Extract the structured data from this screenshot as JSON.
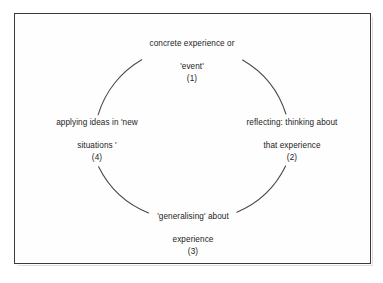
{
  "diagram": {
    "frame": {
      "border_color": "#3a3a3a"
    },
    "circle": {
      "stroke_color": "#4a4a4a",
      "center_x": 192,
      "center_y": 140,
      "radius": 95
    },
    "stages": [
      {
        "id": "stage-1",
        "position": "top",
        "line1": "concrete experience or",
        "line2": "'event'",
        "number": "(1)"
      },
      {
        "id": "stage-2",
        "position": "right",
        "line1": "reflecting: thinking about",
        "line2": "that experience",
        "number": "(2)"
      },
      {
        "id": "stage-3",
        "position": "bottom",
        "line1": "'generalising' about",
        "line2": "experience",
        "number": "(3)"
      },
      {
        "id": "stage-4",
        "position": "left",
        "line1": "applying ideas in 'new",
        "line2": "situations '",
        "number": "(4)"
      }
    ]
  }
}
